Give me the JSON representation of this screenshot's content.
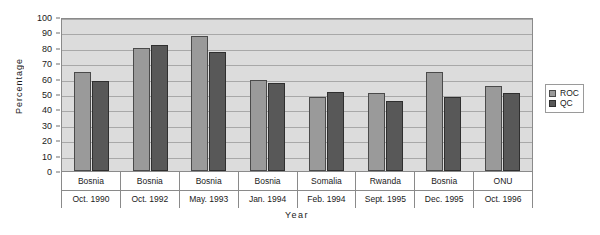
{
  "chart_data": {
    "type": "bar",
    "title": "",
    "xlabel": "Year",
    "ylabel": "Percentage",
    "ylim": [
      0,
      100
    ],
    "yticks": [
      100,
      90,
      80,
      70,
      60,
      50,
      40,
      30,
      20,
      10,
      0
    ],
    "grid": true,
    "legend_position": "right",
    "categories": [
      {
        "place": "Bosnia",
        "date": "Oct. 1990"
      },
      {
        "place": "Bosnia",
        "date": "Oct. 1992"
      },
      {
        "place": "Bosnia",
        "date": "May. 1993"
      },
      {
        "place": "Bosnia",
        "date": "Jan. 1994"
      },
      {
        "place": "Somalia",
        "date": "Feb. 1994"
      },
      {
        "place": "Rwanda",
        "date": "Sept. 1995"
      },
      {
        "place": "Bosnia",
        "date": "Dec. 1995"
      },
      {
        "place": "ONU",
        "date": "Oct. 1996"
      }
    ],
    "series": [
      {
        "name": "ROC",
        "color": "#9a9a9a",
        "values": [
          65,
          81,
          89,
          60,
          49,
          51,
          65,
          56
        ]
      },
      {
        "name": "QC",
        "color": "#585858",
        "values": [
          59,
          83,
          78,
          58,
          52,
          46,
          49,
          51
        ]
      }
    ]
  },
  "legend": {
    "items": [
      {
        "label": "ROC"
      },
      {
        "label": "QC"
      }
    ]
  },
  "colors": {
    "plot_background": "#dcdcdc",
    "gridline": "#a8a8a8",
    "axis": "#8a8a8a",
    "series_roc": "#9a9a9a",
    "series_qc": "#585858",
    "page_background": "#ffffff"
  }
}
